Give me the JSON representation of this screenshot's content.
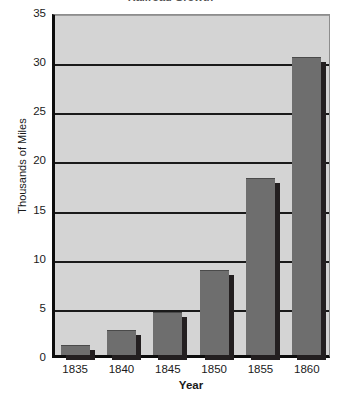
{
  "chart_data": {
    "type": "bar",
    "title": "Railroad Growth",
    "categories": [
      "1835",
      "1840",
      "1845",
      "1850",
      "1855",
      "1860"
    ],
    "values": [
      1.0,
      2.5,
      4.4,
      8.7,
      18.0,
      30.3
    ],
    "xlabel": "Year",
    "ylabel": "Thousands of Miles",
    "ylim": [
      0,
      35
    ],
    "ytick_labels": [
      "35",
      "30",
      "25",
      "20",
      "15",
      "10",
      "5",
      "0"
    ],
    "ytick_values": [
      35,
      30,
      25,
      20,
      15,
      10,
      5,
      0
    ],
    "ytick_step": 5,
    "grid": true,
    "legend": false,
    "series_color": "#6e6e6e",
    "plot_background": "#d4d4d4",
    "axis_color": "#0c0c0c",
    "gridline_color": "#1a1a1a"
  }
}
